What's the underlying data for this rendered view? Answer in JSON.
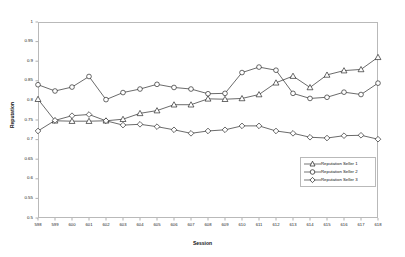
{
  "chart_data": {
    "type": "line",
    "title": "",
    "xlabel": "Session",
    "ylabel": "Reputation",
    "grid": false,
    "legend_position": "lower-right",
    "xlim": [
      598,
      618
    ],
    "ylim": [
      0.5,
      1
    ],
    "ytick_labels": [
      "1",
      "0.95",
      "0.9",
      "0.85",
      "0.8",
      "0.75",
      "0.7",
      "0.65",
      "0.6",
      "0.55",
      "0.5"
    ],
    "ytick_values": [
      1,
      0.95,
      0.9,
      0.85,
      0.8,
      0.75,
      0.7,
      0.65,
      0.6,
      0.55,
      0.5
    ],
    "categories": [
      "598",
      "599",
      "600",
      "601",
      "602",
      "603",
      "604",
      "605",
      "606",
      "607",
      "608",
      "609",
      "610",
      "611",
      "612",
      "613",
      "614",
      "615",
      "616",
      "617",
      "618"
    ],
    "x": [
      598,
      599,
      600,
      601,
      602,
      603,
      604,
      605,
      606,
      607,
      608,
      609,
      610,
      611,
      612,
      613,
      614,
      615,
      616,
      617,
      618
    ],
    "series": [
      {
        "name": "Reputation Seller 1",
        "marker": "triangle",
        "color": "#1a1a1a",
        "values": [
          0.803,
          0.748,
          0.747,
          0.747,
          0.748,
          0.752,
          0.767,
          0.774,
          0.789,
          0.789,
          0.804,
          0.803,
          0.805,
          0.815,
          0.845,
          0.862,
          0.833,
          0.865,
          0.876,
          0.879,
          0.91
        ]
      },
      {
        "name": "Reputation Seller 2",
        "marker": "circle",
        "color": "#1a1a1a",
        "values": [
          0.84,
          0.824,
          0.834,
          0.861,
          0.802,
          0.82,
          0.829,
          0.841,
          0.833,
          0.829,
          0.817,
          0.818,
          0.871,
          0.885,
          0.877,
          0.818,
          0.805,
          0.808,
          0.821,
          0.815,
          0.844
        ]
      },
      {
        "name": "Reputation Seller 3",
        "marker": "diamond",
        "color": "#1a1a1a",
        "values": [
          0.722,
          0.749,
          0.761,
          0.764,
          0.748,
          0.737,
          0.739,
          0.733,
          0.725,
          0.716,
          0.722,
          0.725,
          0.735,
          0.735,
          0.722,
          0.716,
          0.706,
          0.704,
          0.71,
          0.711,
          0.701
        ]
      }
    ]
  },
  "legend": {
    "entries": [
      {
        "label": "Reputation Seller 1"
      },
      {
        "label": "Reputation Seller 2"
      },
      {
        "label": "Reputation Seller 3"
      }
    ]
  }
}
